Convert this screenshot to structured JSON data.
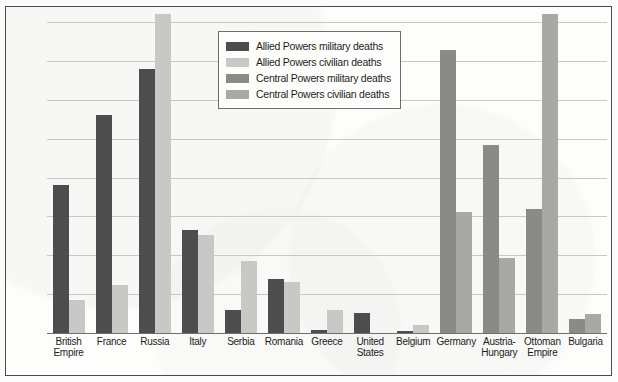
{
  "chart_data": {
    "type": "bar",
    "title": "",
    "xlabel": "",
    "ylabel": "",
    "ylim": [
      0,
      2.0
    ],
    "ytick_labels": [
      "0",
      "0.25",
      "0.50",
      "0.75",
      "1.00",
      "1.25",
      "1.50",
      "1.75",
      "2.00"
    ],
    "ytick_values": [
      0,
      0.25,
      0.5,
      0.75,
      1.0,
      1.25,
      1.5,
      1.75,
      2.0
    ],
    "grid": true,
    "legend_position": "top-center",
    "note_clipped": "Russia and Ottoman Empire civilian bars extend beyond the 2.00 axis maximum",
    "categories": [
      "British Empire",
      "France",
      "Russia",
      "Italy",
      "Serbia",
      "Romania",
      "Greece",
      "United States",
      "Belgium",
      "Germany",
      "Austria-Hungary",
      "Ottoman Empire",
      "Bulgaria"
    ],
    "category_lines": [
      [
        "British",
        "Empire"
      ],
      [
        "France"
      ],
      [
        "Russia"
      ],
      [
        "Italy"
      ],
      [
        "Serbia"
      ],
      [
        "Romania"
      ],
      [
        "Greece"
      ],
      [
        "United",
        "States"
      ],
      [
        "Belgium"
      ],
      [
        "Germany"
      ],
      [
        "Austria-",
        "Hungary"
      ],
      [
        "Ottoman",
        "Empire"
      ],
      [
        "Bulgaria"
      ]
    ],
    "series": [
      {
        "name": "Allied Powers military deaths",
        "color": "#4d4d4d",
        "values": [
          0.95,
          1.4,
          1.7,
          0.66,
          0.15,
          0.35,
          0.02,
          0.13,
          0.01,
          null,
          null,
          null,
          null
        ]
      },
      {
        "name": "Allied Powers civilian deaths",
        "color": "#c8c8c6",
        "values": [
          0.21,
          0.31,
          2.0,
          0.63,
          0.46,
          0.33,
          0.15,
          0.0,
          0.05,
          null,
          null,
          null,
          null
        ]
      },
      {
        "name": "Central Powers military deaths",
        "color": "#8a8a88",
        "values": [
          null,
          null,
          null,
          null,
          null,
          null,
          null,
          null,
          null,
          1.82,
          1.21,
          0.8,
          0.09
        ]
      },
      {
        "name": "Central Powers civilian deaths",
        "color": "#a8a8a6",
        "values": [
          null,
          null,
          null,
          null,
          null,
          null,
          null,
          null,
          null,
          0.78,
          0.48,
          2.0,
          0.12
        ]
      }
    ],
    "clipped_points": [
      {
        "category": "Russia",
        "series": "Allied Powers civilian deaths"
      },
      {
        "category": "Ottoman Empire",
        "series": "Central Powers civilian deaths"
      }
    ]
  },
  "legend": {
    "items": [
      {
        "label": "Allied Powers military deaths",
        "color": "#4d4d4d"
      },
      {
        "label": "Allied Powers civilian deaths",
        "color": "#c8c8c6"
      },
      {
        "label": "Central Powers military deaths",
        "color": "#8a8a88"
      },
      {
        "label": "Central Powers civilian deaths",
        "color": "#a8a8a6"
      }
    ]
  }
}
